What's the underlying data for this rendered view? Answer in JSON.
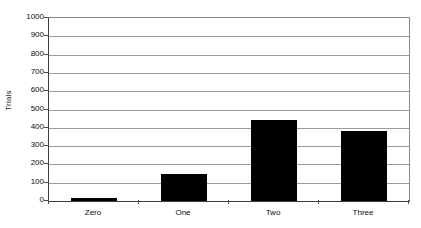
{
  "chart_data": {
    "type": "bar",
    "title": "",
    "subtitle": "",
    "xlabel": "",
    "ylabel": "Trials",
    "categories": [
      "Zero",
      "One",
      "Two",
      "Three"
    ],
    "values": [
      15,
      145,
      440,
      380
    ],
    "series": [
      {
        "name": "Trials",
        "values": [
          15,
          145,
          440,
          380
        ]
      }
    ],
    "ylim": [
      0,
      1000
    ],
    "y_tick_step": 100,
    "y_tick_labels": [
      "1000",
      "900",
      "800",
      "700",
      "600",
      "500",
      "400",
      "300",
      "200",
      "100",
      "0"
    ],
    "y_tick_values": [
      1000,
      900,
      800,
      700,
      600,
      500,
      400,
      300,
      200,
      100,
      0
    ],
    "grid": "horizontal",
    "legend": "none",
    "orientation": "vertical",
    "bar_color": "#000000",
    "gridline_color": "#9a9a9a",
    "axis_color": "#3d3d3d",
    "background_color": "#ffffff",
    "plot_border": true
  },
  "axes": {
    "y_title": "Trials"
  }
}
